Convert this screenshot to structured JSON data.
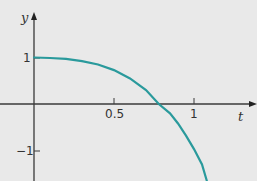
{
  "chart_data": {
    "type": "line",
    "title": "",
    "xlabel": "t",
    "ylabel": "y",
    "xlim": [
      -0.21,
      1.4
    ],
    "ylim": [
      -1.65,
      2.2
    ],
    "grid": false,
    "legend": null,
    "x_ticks": [
      {
        "value": 0.5,
        "label": "0.5"
      },
      {
        "value": 1,
        "label": "1"
      }
    ],
    "y_ticks": [
      {
        "value": 1,
        "label": "1"
      },
      {
        "value": -1,
        "label": "−1"
      }
    ],
    "series": [
      {
        "name": "curve",
        "color": "#2a9a9c",
        "x": [
          0,
          0.1,
          0.2,
          0.3,
          0.4,
          0.5,
          0.6,
          0.7,
          0.78,
          0.85,
          0.9,
          0.95,
          1.0,
          1.05,
          1.08
        ],
        "y": [
          1,
          0.99,
          0.97,
          0.92,
          0.85,
          0.73,
          0.55,
          0.3,
          0.0,
          -0.2,
          -0.42,
          -0.68,
          -0.97,
          -1.3,
          -1.65
        ]
      }
    ]
  },
  "labels": {
    "y_axis": "y",
    "t_axis": "t",
    "tick_half": "0.5",
    "tick_one_t": "1",
    "tick_one_y": "1",
    "tick_neg_one_y": "−1"
  }
}
